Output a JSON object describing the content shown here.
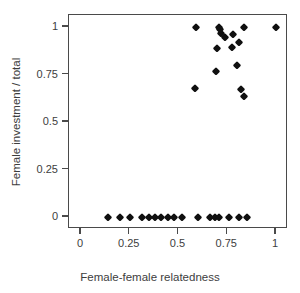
{
  "chart_data": {
    "type": "scatter",
    "title": "",
    "xlabel": "Female-female relatedness",
    "ylabel": "Female investment / total",
    "xlim": [
      0,
      1
    ],
    "ylim": [
      0,
      1
    ],
    "xticks": [
      0,
      0.25,
      0.5,
      0.75,
      1
    ],
    "xticklabels": [
      "0",
      "0.25",
      "0.5",
      "0.75",
      "1"
    ],
    "yticks": [
      0,
      0.25,
      0.5,
      0.75,
      1
    ],
    "yticklabels": [
      "0",
      "0.25",
      "0.5",
      "0.75",
      "1"
    ],
    "grid": false,
    "legend": null,
    "marker": "filled-diamond",
    "marker_color": "#101010",
    "frame_color": "#4a4a4a",
    "background": "#ffffff",
    "series": [
      {
        "name": "colonies",
        "points": [
          {
            "x": 0.14,
            "y": 0.0
          },
          {
            "x": 0.2,
            "y": 0.0
          },
          {
            "x": 0.25,
            "y": 0.0
          },
          {
            "x": 0.315,
            "y": 0.0
          },
          {
            "x": 0.35,
            "y": 0.0
          },
          {
            "x": 0.38,
            "y": 0.0
          },
          {
            "x": 0.41,
            "y": 0.0
          },
          {
            "x": 0.445,
            "y": 0.0
          },
          {
            "x": 0.475,
            "y": 0.0
          },
          {
            "x": 0.52,
            "y": 0.0
          },
          {
            "x": 0.6,
            "y": 0.0
          },
          {
            "x": 0.66,
            "y": 0.0
          },
          {
            "x": 0.685,
            "y": 0.0
          },
          {
            "x": 0.71,
            "y": 0.0
          },
          {
            "x": 0.76,
            "y": 0.0
          },
          {
            "x": 0.81,
            "y": 0.0
          },
          {
            "x": 0.85,
            "y": 0.0
          },
          {
            "x": 0.585,
            "y": 0.68
          },
          {
            "x": 0.59,
            "y": 1.0
          },
          {
            "x": 0.69,
            "y": 0.77
          },
          {
            "x": 0.695,
            "y": 0.89
          },
          {
            "x": 0.71,
            "y": 1.0
          },
          {
            "x": 0.715,
            "y": 0.99
          },
          {
            "x": 0.72,
            "y": 0.97
          },
          {
            "x": 0.74,
            "y": 0.95
          },
          {
            "x": 0.775,
            "y": 0.895
          },
          {
            "x": 0.78,
            "y": 0.965
          },
          {
            "x": 0.8,
            "y": 0.8
          },
          {
            "x": 0.81,
            "y": 0.92
          },
          {
            "x": 0.82,
            "y": 0.675
          },
          {
            "x": 0.835,
            "y": 1.0
          },
          {
            "x": 0.835,
            "y": 0.635
          },
          {
            "x": 1.0,
            "y": 1.0
          }
        ]
      }
    ]
  }
}
